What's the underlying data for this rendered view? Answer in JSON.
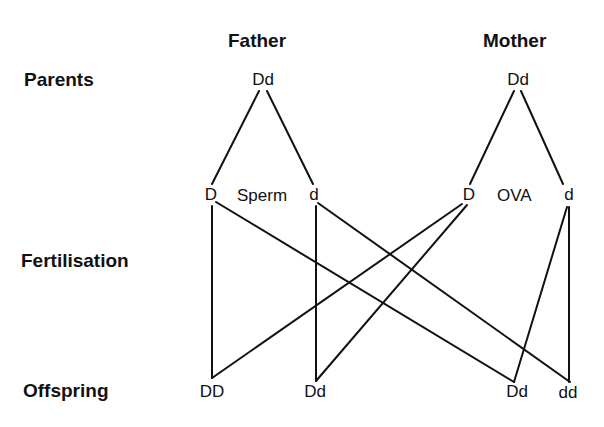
{
  "title_columns": {
    "father": "Father",
    "mother": "Mother"
  },
  "row_labels": {
    "parents": "Parents",
    "fertilisation": "Fertilisation",
    "offspring": "Offspring"
  },
  "parents": {
    "father_genotype": "Dd",
    "mother_genotype": "Dd"
  },
  "gametes": {
    "sperm_label": "Sperm",
    "ova_label": "OVA",
    "sperm": [
      "D",
      "d"
    ],
    "ova": [
      "D",
      "d"
    ]
  },
  "offspring": [
    "DD",
    "Dd",
    "Dd",
    "dd"
  ],
  "crosses": [
    {
      "from": "sperm D",
      "with": "ova D",
      "result": "DD"
    },
    {
      "from": "sperm d",
      "with": "ova D",
      "result": "Dd"
    },
    {
      "from": "sperm D",
      "with": "ova d",
      "result": "Dd"
    },
    {
      "from": "sperm d",
      "with": "ova d",
      "result": "dd"
    }
  ],
  "colors": {
    "ink": "#111111",
    "background": "#ffffff"
  }
}
